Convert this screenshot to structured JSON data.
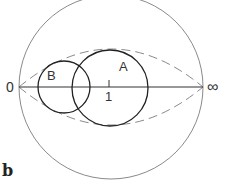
{
  "labels": {
    "zero": "0",
    "infinity": "∞",
    "circle_a": "A",
    "circle_b": "B",
    "unit": "1",
    "panel": "b"
  },
  "geometry": {
    "outer_circle": {
      "cx": 111,
      "cy": 87,
      "r": 92
    },
    "circle_a": {
      "cx": 110,
      "cy": 88,
      "r": 38
    },
    "circle_b": {
      "cx": 64,
      "cy": 87,
      "r": 26
    },
    "axis": {
      "x1": 19,
      "y1": 87,
      "x2": 203,
      "y2": 87
    },
    "lens_top_apex_y": 49,
    "lens_bottom_apex_y": 125
  },
  "colors": {
    "outer": "#8a8a8a",
    "circles": "#222222",
    "dashed": "#8a8a8a",
    "axis": "#333333"
  }
}
